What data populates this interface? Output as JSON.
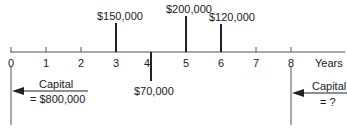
{
  "diagram": {
    "type": "cash-flow-timeline",
    "axis_label": "Years",
    "ticks": [
      "0",
      "1",
      "2",
      "3",
      "4",
      "5",
      "6",
      "7",
      "8"
    ],
    "cash_flows": [
      {
        "year": 3,
        "amount": "$150,000",
        "direction": "up"
      },
      {
        "year": 4,
        "amount": "$70,000",
        "direction": "down"
      },
      {
        "year": 5,
        "amount": "$200,000",
        "direction": "up"
      },
      {
        "year": 6,
        "amount": "$120,000",
        "direction": "up"
      }
    ],
    "start_capital": {
      "year": 0,
      "label": "Capital",
      "value": "= $800,000"
    },
    "end_capital": {
      "year": 8,
      "label": "Capital",
      "value": "= ?"
    },
    "colors": {
      "line": "#333333",
      "text": "#1a1a1a"
    }
  }
}
